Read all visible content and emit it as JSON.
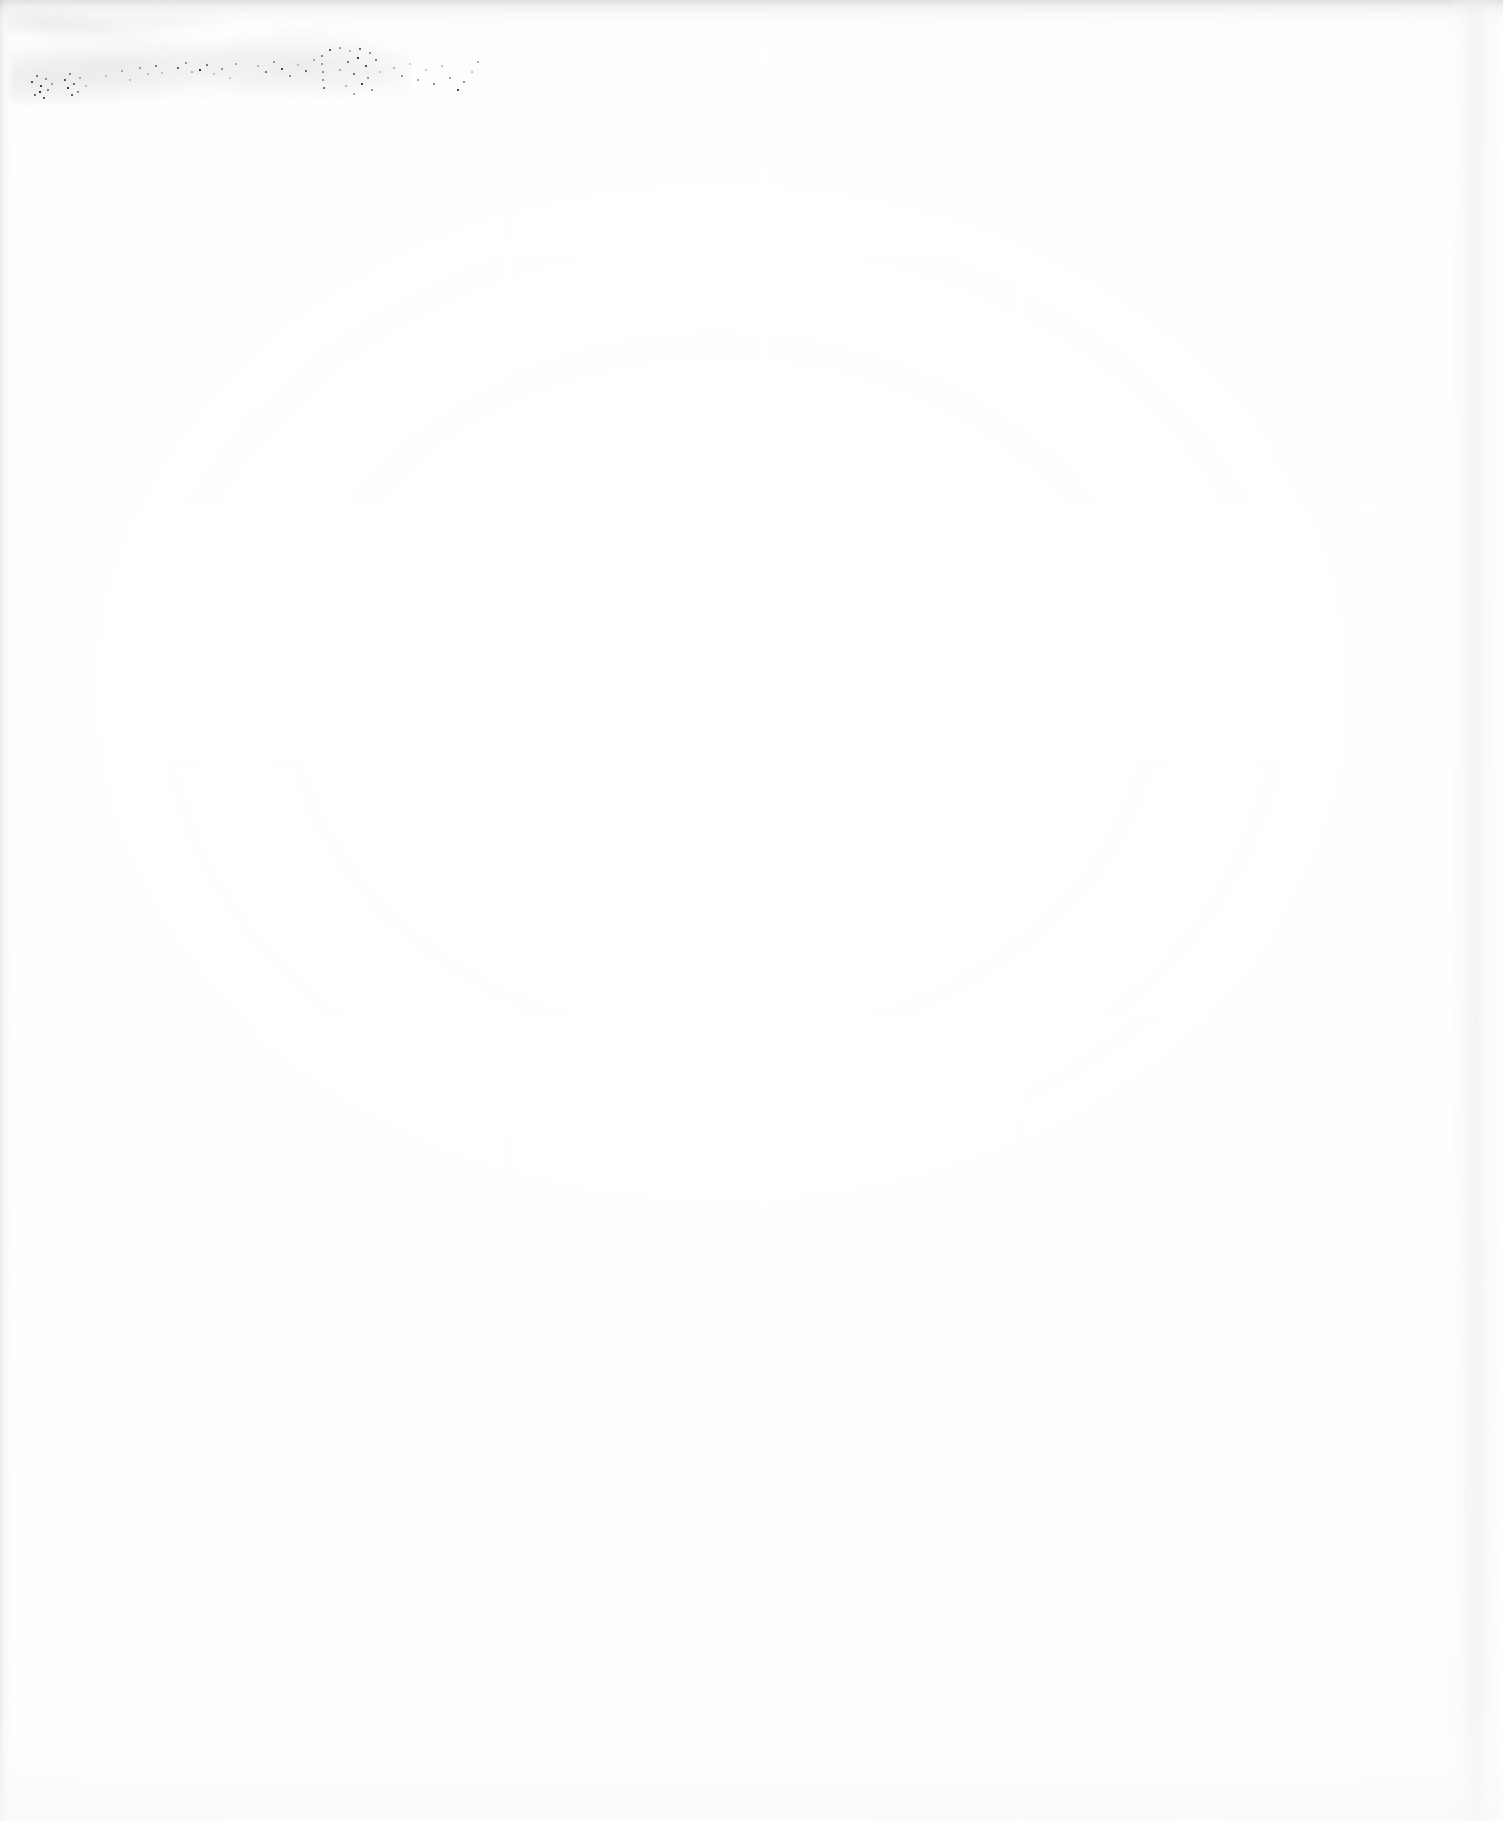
{
  "document": {
    "kind": "scanned-page",
    "page_type": "blank page with faint handwritten annotation",
    "page_width_px": 1503,
    "page_height_px": 1821,
    "background_color": "#ffffff",
    "ink_color": "#3a3c40",
    "edge_shadow_color": "#bcbec2"
  },
  "annotation": {
    "present": true,
    "legible": false,
    "transcription": "",
    "description": "single faded, heavily degraded line of handwriting near the top-left margin; characters broken into disconnected ink specks and unreadable",
    "position": {
      "left_px": 10,
      "top_px": 38,
      "width_px": 470,
      "height_px": 62
    },
    "ink_color": "#3a3c40",
    "opacity": "very low"
  },
  "body": {
    "content": "",
    "description": "remainder of the page is blank white paper with only scanner dust specks"
  },
  "edges": {
    "top": {
      "description": "soft gray scan shadow along the top trim",
      "color": "#96989c"
    },
    "left": {
      "description": "narrow light-gray band along the left trim",
      "color": "#aaacb0"
    },
    "right": {
      "description": "pale gray vertical band near the right trim",
      "color": "#ebeced"
    },
    "bottom": {
      "description": "very faint light gradient toward the bottom trim",
      "color": "#f9f9fa"
    }
  }
}
